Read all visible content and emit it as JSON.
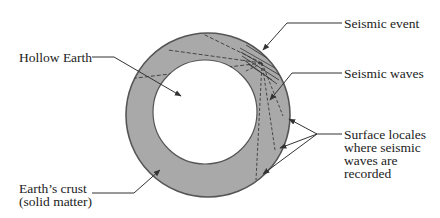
{
  "diagram": {
    "colors": {
      "crust_fill": "#a9a9a9",
      "outline": "#555555",
      "wave_lines": "#3a3a3a",
      "leader_lines": "#333333",
      "text": "#222222",
      "background": "#ffffff"
    },
    "labels": {
      "hollow_earth": "Hollow Earth",
      "seismic_event": "Seismic event",
      "seismic_waves": "Seismic waves",
      "surface_locales": [
        "Surface locales",
        "where seismic",
        "waves are",
        "recorded"
      ],
      "earths_crust": [
        "Earth’s crust",
        "(solid matter)"
      ]
    }
  }
}
